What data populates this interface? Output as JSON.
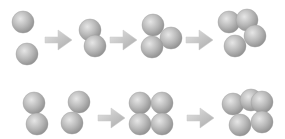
{
  "diagram": {
    "colors": {
      "sphere_highlight": "#e6e6e6",
      "sphere_mid": "#b8b8b8",
      "sphere_shadow": "#8e8e8e",
      "arrow_light": "#e4e4e4",
      "arrow_dark": "#a9a9a9",
      "background": "#ffffff"
    },
    "sphere_radius": 11,
    "rows": [
      {
        "name": "top-row",
        "stages": [
          {
            "spheres": [
              [
                23,
                22
              ],
              [
                27,
                54
              ]
            ]
          },
          {
            "spheres": [
              [
                90,
                30
              ],
              [
                95,
                46
              ]
            ]
          },
          {
            "spheres": [
              [
                153,
                25
              ],
              [
                171,
                38
              ],
              [
                152,
                47
              ]
            ]
          },
          {
            "spheres": [
              [
                229,
                22
              ],
              [
                247,
                20
              ],
              [
                255,
                36
              ],
              [
                235,
                46
              ]
            ]
          }
        ],
        "arrows": [
          [
            45,
            40
          ],
          [
            110,
            40
          ],
          [
            186,
            40
          ]
        ]
      },
      {
        "name": "bottom-row",
        "stages": [
          {
            "spheres": [
              [
                34,
                103
              ],
              [
                37,
                124
              ]
            ]
          },
          {
            "spheres": [
              [
                79,
                102
              ],
              [
                72,
                123
              ]
            ]
          },
          {
            "spheres": [
              [
                140,
                103
              ],
              [
                162,
                103
              ],
              [
                140,
                124
              ],
              [
                162,
                124
              ]
            ]
          },
          {
            "spheres": [
              [
                233,
                104
              ],
              [
                251,
                100
              ],
              [
                262,
                102
              ],
              [
                240,
                125
              ],
              [
                262,
                122
              ]
            ]
          }
        ],
        "arrows": [
          [
            98,
            118
          ],
          [
            187,
            118
          ]
        ]
      }
    ]
  }
}
